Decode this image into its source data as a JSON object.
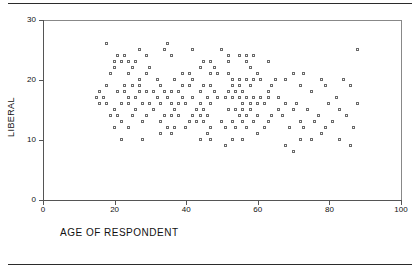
{
  "figure": {
    "background": "#ffffff",
    "marker_color": "#6a6a6a",
    "axis_color": "#555555",
    "rules": [
      "top-rule",
      "bottom-rule"
    ]
  },
  "chart_data": {
    "type": "scatter",
    "title": "",
    "xlabel": "AGE OF RESPONDENT",
    "ylabel": "LIBERAL",
    "xlim": [
      0,
      100
    ],
    "ylim": [
      0,
      30
    ],
    "xticks": [
      0,
      20,
      40,
      60,
      80,
      100
    ],
    "yticks": [
      0,
      10,
      20,
      30
    ],
    "xtick_labels": [
      "0",
      "20",
      "40",
      "60",
      "80",
      "100"
    ],
    "ytick_labels": [
      "0",
      "10",
      "20",
      "30"
    ],
    "grid": false,
    "legend": null,
    "marker": "open-square",
    "points": [
      [
        18,
        26
      ],
      [
        35,
        26
      ],
      [
        27,
        25
      ],
      [
        34,
        25
      ],
      [
        42,
        25
      ],
      [
        50,
        25
      ],
      [
        88,
        25
      ],
      [
        21,
        24
      ],
      [
        23,
        24
      ],
      [
        29,
        24
      ],
      [
        36,
        24
      ],
      [
        52,
        24
      ],
      [
        55,
        24
      ],
      [
        57,
        24
      ],
      [
        59,
        24
      ],
      [
        20,
        23
      ],
      [
        22,
        23
      ],
      [
        24,
        23
      ],
      [
        26,
        23
      ],
      [
        45,
        23
      ],
      [
        47,
        23
      ],
      [
        52,
        23
      ],
      [
        57,
        23
      ],
      [
        63,
        23
      ],
      [
        20,
        22
      ],
      [
        25,
        22
      ],
      [
        30,
        22
      ],
      [
        44,
        22
      ],
      [
        48,
        22
      ],
      [
        58,
        22
      ],
      [
        19,
        21
      ],
      [
        24,
        21
      ],
      [
        29,
        21
      ],
      [
        39,
        21
      ],
      [
        41,
        21
      ],
      [
        47,
        21
      ],
      [
        49,
        21
      ],
      [
        52,
        21
      ],
      [
        60,
        21
      ],
      [
        70,
        21
      ],
      [
        73,
        21
      ],
      [
        27,
        20
      ],
      [
        32,
        20
      ],
      [
        37,
        20
      ],
      [
        42,
        20
      ],
      [
        53,
        20
      ],
      [
        55,
        20
      ],
      [
        57,
        20
      ],
      [
        59,
        20
      ],
      [
        61,
        20
      ],
      [
        65,
        20
      ],
      [
        68,
        20
      ],
      [
        78,
        20
      ],
      [
        84,
        20
      ],
      [
        18,
        19
      ],
      [
        23,
        19
      ],
      [
        25,
        19
      ],
      [
        27,
        19
      ],
      [
        33,
        19
      ],
      [
        39,
        19
      ],
      [
        41,
        19
      ],
      [
        45,
        19
      ],
      [
        47,
        19
      ],
      [
        53,
        19
      ],
      [
        55,
        19
      ],
      [
        58,
        19
      ],
      [
        64,
        19
      ],
      [
        72,
        19
      ],
      [
        79,
        19
      ],
      [
        86,
        19
      ],
      [
        16,
        18
      ],
      [
        21,
        18
      ],
      [
        23,
        18
      ],
      [
        27,
        18
      ],
      [
        29,
        18
      ],
      [
        31,
        18
      ],
      [
        34,
        18
      ],
      [
        36,
        18
      ],
      [
        38,
        18
      ],
      [
        44,
        18
      ],
      [
        48,
        18
      ],
      [
        52,
        18
      ],
      [
        54,
        18
      ],
      [
        56,
        18
      ],
      [
        63,
        18
      ],
      [
        75,
        18
      ],
      [
        15,
        17
      ],
      [
        17,
        17
      ],
      [
        24,
        17
      ],
      [
        26,
        17
      ],
      [
        32,
        17
      ],
      [
        35,
        17
      ],
      [
        39,
        17
      ],
      [
        42,
        17
      ],
      [
        46,
        17
      ],
      [
        49,
        17
      ],
      [
        51,
        17
      ],
      [
        53,
        17
      ],
      [
        55,
        17
      ],
      [
        57,
        17
      ],
      [
        59,
        17
      ],
      [
        61,
        17
      ],
      [
        63,
        17
      ],
      [
        66,
        17
      ],
      [
        82,
        17
      ],
      [
        16,
        16
      ],
      [
        18,
        16
      ],
      [
        22,
        16
      ],
      [
        24,
        16
      ],
      [
        28,
        16
      ],
      [
        30,
        16
      ],
      [
        33,
        16
      ],
      [
        36,
        16
      ],
      [
        38,
        16
      ],
      [
        40,
        16
      ],
      [
        44,
        16
      ],
      [
        47,
        16
      ],
      [
        56,
        16
      ],
      [
        58,
        16
      ],
      [
        60,
        16
      ],
      [
        62,
        16
      ],
      [
        68,
        16
      ],
      [
        71,
        16
      ],
      [
        80,
        16
      ],
      [
        88,
        16
      ],
      [
        20,
        15
      ],
      [
        26,
        15
      ],
      [
        31,
        15
      ],
      [
        37,
        15
      ],
      [
        43,
        15
      ],
      [
        45,
        15
      ],
      [
        52,
        15
      ],
      [
        54,
        15
      ],
      [
        56,
        15
      ],
      [
        58,
        15
      ],
      [
        66,
        15
      ],
      [
        70,
        15
      ],
      [
        74,
        15
      ],
      [
        83,
        15
      ],
      [
        19,
        14
      ],
      [
        21,
        14
      ],
      [
        25,
        14
      ],
      [
        29,
        14
      ],
      [
        34,
        14
      ],
      [
        36,
        14
      ],
      [
        38,
        14
      ],
      [
        42,
        14
      ],
      [
        44,
        14
      ],
      [
        46,
        14
      ],
      [
        55,
        14
      ],
      [
        57,
        14
      ],
      [
        60,
        14
      ],
      [
        64,
        14
      ],
      [
        67,
        14
      ],
      [
        77,
        14
      ],
      [
        85,
        14
      ],
      [
        22,
        13
      ],
      [
        28,
        13
      ],
      [
        33,
        13
      ],
      [
        41,
        13
      ],
      [
        43,
        13
      ],
      [
        45,
        13
      ],
      [
        50,
        13
      ],
      [
        53,
        13
      ],
      [
        56,
        13
      ],
      [
        59,
        13
      ],
      [
        63,
        13
      ],
      [
        72,
        13
      ],
      [
        76,
        13
      ],
      [
        81,
        13
      ],
      [
        20,
        12
      ],
      [
        24,
        12
      ],
      [
        35,
        12
      ],
      [
        37,
        12
      ],
      [
        40,
        12
      ],
      [
        47,
        12
      ],
      [
        51,
        12
      ],
      [
        54,
        12
      ],
      [
        57,
        12
      ],
      [
        62,
        12
      ],
      [
        69,
        12
      ],
      [
        73,
        12
      ],
      [
        79,
        12
      ],
      [
        87,
        12
      ],
      [
        33,
        11
      ],
      [
        36,
        11
      ],
      [
        46,
        11
      ],
      [
        60,
        11
      ],
      [
        78,
        11
      ],
      [
        22,
        10
      ],
      [
        28,
        10
      ],
      [
        44,
        10
      ],
      [
        47,
        10
      ],
      [
        53,
        10
      ],
      [
        56,
        10
      ],
      [
        72,
        10
      ],
      [
        75,
        10
      ],
      [
        83,
        10
      ],
      [
        51,
        9
      ],
      [
        68,
        9
      ],
      [
        86,
        9
      ],
      [
        70,
        8
      ]
    ]
  }
}
